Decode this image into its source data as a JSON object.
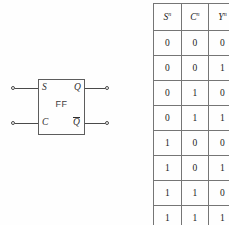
{
  "figure": {
    "diagram": {
      "block_label": "FF",
      "input_ports": [
        {
          "name": "set-input",
          "label": "S"
        },
        {
          "name": "clear-input",
          "label": "C"
        }
      ],
      "output_ports": [
        {
          "name": "q-output",
          "label": "Q",
          "complemented": false
        },
        {
          "name": "q-bar-output",
          "label": "Q",
          "complemented": true
        }
      ]
    },
    "truth_table": {
      "headers": [
        {
          "symbol": "S",
          "superscript": "n"
        },
        {
          "symbol": "C",
          "superscript": "n"
        },
        {
          "symbol": "Y",
          "superscript": "n"
        }
      ],
      "rows": [
        [
          "0",
          "0",
          "0"
        ],
        [
          "0",
          "0",
          "1"
        ],
        [
          "0",
          "1",
          "0"
        ],
        [
          "0",
          "1",
          "1"
        ],
        [
          "1",
          "0",
          "0"
        ],
        [
          "1",
          "0",
          "1"
        ],
        [
          "1",
          "1",
          "0"
        ],
        [
          "1",
          "1",
          "1"
        ]
      ]
    }
  }
}
